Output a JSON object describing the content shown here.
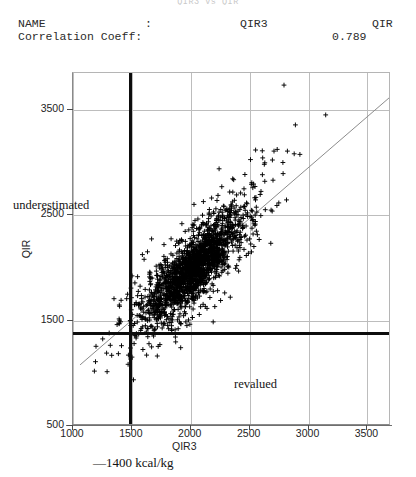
{
  "header": {
    "title_partial": "QIR3 vs QIR",
    "rows": [
      {
        "label": "NAME",
        "colon": ":",
        "value": "QIR3",
        "right": "QIR"
      },
      {
        "label": "Correlation Coeff:",
        "value": "0.789"
      }
    ]
  },
  "annotations": {
    "underestimated": "underestimated",
    "revalued": "revalued",
    "threshold": "—1400 kcal/kg"
  },
  "chart_data": {
    "type": "scatter",
    "title": "QIR3 vs QIR",
    "xlabel": "QIR3",
    "ylabel": "QIR",
    "xlim": [
      1000,
      3700
    ],
    "ylim": [
      500,
      3850
    ],
    "xticks": [
      1000,
      1500,
      2000,
      2500,
      3000,
      3500
    ],
    "yticks": [
      500,
      1500,
      2500,
      3500
    ],
    "grid": true,
    "legend": "none",
    "marker": "+",
    "marker_color": "#000000",
    "n_points": 2000,
    "correlation": 0.789,
    "fit_line": {
      "name": "identity-trend-line",
      "color": "#8c8c8c",
      "x0": 1060,
      "y0": 1080,
      "x1": 3690,
      "y1": 3620
    },
    "reference_lines": [
      {
        "name": "vertical-threshold",
        "orientation": "vertical",
        "value": 1480,
        "color": "#0d0d0d",
        "width": 3
      },
      {
        "name": "horizontal-threshold",
        "orientation": "horizontal",
        "value": 1380,
        "color": "#0d0d0d",
        "width": 3
      }
    ],
    "cluster": {
      "x_mean": 2020,
      "x_sd": 330,
      "y_mean": 1990,
      "y_sd": 390,
      "x_min": 1180,
      "x_max": 3620,
      "y_min": 620,
      "y_max": 3760
    },
    "regions": [
      {
        "label": "underestimated",
        "x": 1130,
        "y": 2620
      },
      {
        "label": "revalued",
        "x": 2150,
        "y": 900
      }
    ]
  }
}
